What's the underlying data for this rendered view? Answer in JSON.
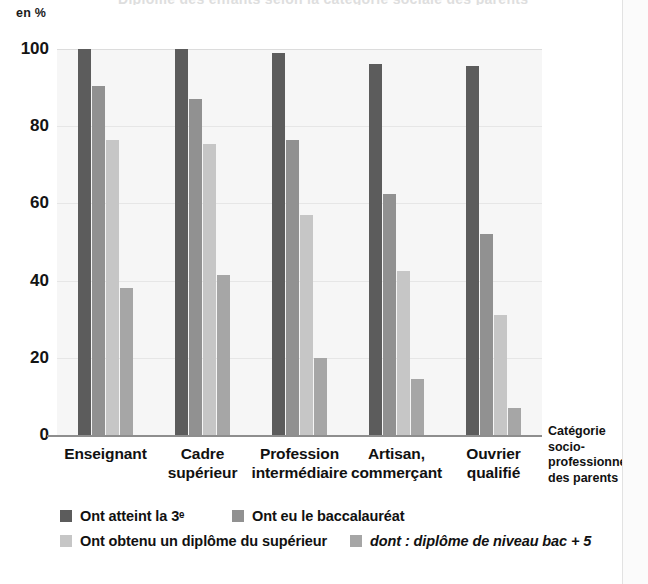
{
  "page": {
    "unit_label": "en %",
    "cut_title": "Diplôme des enfants selon la catégorie sociale des parents",
    "divider_color": "#e2e2e2"
  },
  "chart_data": {
    "type": "bar",
    "title": "",
    "xlabel": "Catégorie socio-professionnelle des parents",
    "ylabel": "en %",
    "ylim": [
      0,
      100
    ],
    "yticks": [
      100,
      80,
      60,
      40,
      20,
      0
    ],
    "grid": true,
    "legend_position": "bottom",
    "categories": [
      "Enseignant",
      "Cadre supérieur",
      "Profession intermédiaire",
      "Artisan, commerçant",
      "Ouvrier qualifié"
    ],
    "category_lines": [
      [
        "Enseignant"
      ],
      [
        "Cadre",
        "supérieur"
      ],
      [
        "Profession",
        "intermédiaire"
      ],
      [
        "Artisan,",
        "commerçant"
      ],
      [
        "Ouvrier",
        "qualifié"
      ]
    ],
    "series": [
      {
        "name": "Ont atteint la 3e",
        "label": "Ont atteint la 3ᵉ",
        "color": "#5c5c5c",
        "italic": false,
        "values": [
          100,
          100,
          99,
          96,
          95.5
        ]
      },
      {
        "name": "Ont eu le baccalauréat",
        "label": "Ont eu le baccalauréat",
        "color": "#919191",
        "italic": false,
        "values": [
          90.5,
          87,
          76.5,
          62.5,
          52
        ]
      },
      {
        "name": "Ont obtenu un diplôme du supérieur",
        "label": "Ont obtenu un diplôme du supérieur",
        "color": "#c6c6c6",
        "italic": false,
        "values": [
          76.5,
          75.5,
          57,
          42.5,
          31
        ]
      },
      {
        "name": "dont : diplôme de niveau bac + 5",
        "label": "dont : diplôme de niveau bac + 5",
        "color": "#a6a6a6",
        "italic": true,
        "values": [
          38,
          41.5,
          20,
          14.5,
          7
        ]
      }
    ]
  },
  "axis_caption": {
    "line1": "Catégorie",
    "line2": "socio-",
    "line3": "professionnelle",
    "line4": "des parents"
  }
}
